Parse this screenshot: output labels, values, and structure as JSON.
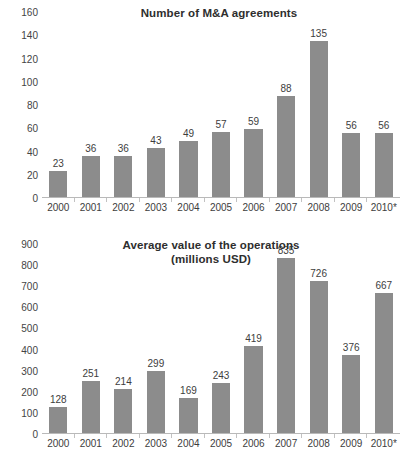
{
  "chart_data": [
    {
      "id": "number-of-ma-agreements",
      "type": "bar",
      "title": "Number of M&A agreements",
      "subtitle": "",
      "xlabel": "",
      "ylabel": "",
      "categories": [
        "2000",
        "2001",
        "2002",
        "2003",
        "2004",
        "2005",
        "2006",
        "2007",
        "2008",
        "2009",
        "2010*"
      ],
      "values": [
        23,
        36,
        36,
        43,
        49,
        57,
        59,
        88,
        135,
        56,
        56
      ],
      "data_labels": [
        "23",
        "36",
        "36",
        "43",
        "49",
        "57",
        "59",
        "88",
        "135",
        "56",
        "56"
      ],
      "ylim": [
        0,
        160
      ],
      "yticks": [
        0,
        20,
        40,
        60,
        80,
        100,
        120,
        140,
        160
      ],
      "ytick_labels": [
        "0",
        "20",
        "40",
        "60",
        "80",
        "100",
        "120",
        "140",
        "160"
      ],
      "grid": false,
      "legend": false,
      "bar_color": "#8c8c8c",
      "axis_color": "#b9b9b9"
    },
    {
      "id": "average-value-of-operations",
      "type": "bar",
      "title": "Average value of the operations",
      "subtitle": "(millions USD)",
      "xlabel": "",
      "ylabel": "",
      "categories": [
        "2000",
        "2001",
        "2002",
        "2003",
        "2004",
        "2005",
        "2006",
        "2007",
        "2008",
        "2009",
        "2010*"
      ],
      "values": [
        128,
        251,
        214,
        299,
        169,
        243,
        419,
        835,
        726,
        376,
        667
      ],
      "data_labels": [
        "128",
        "251",
        "214",
        "299",
        "169",
        "243",
        "419",
        "835",
        "726",
        "376",
        "667"
      ],
      "ylim": [
        0,
        900
      ],
      "yticks": [
        0,
        100,
        200,
        300,
        400,
        500,
        600,
        700,
        800,
        900
      ],
      "ytick_labels": [
        "0",
        "100",
        "200",
        "300",
        "400",
        "500",
        "600",
        "700",
        "800",
        "900"
      ],
      "grid": false,
      "legend": false,
      "bar_color": "#8c8c8c",
      "axis_color": "#b9b9b9"
    }
  ]
}
